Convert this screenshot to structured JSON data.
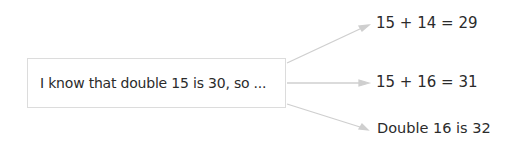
{
  "diagram": {
    "source": {
      "label": "I know that double 15 is 30, so ..."
    },
    "outcomes": [
      {
        "label": "15 + 14 = 29"
      },
      {
        "label": "15 + 16 = 31"
      },
      {
        "label": "Double 16 is 32"
      }
    ],
    "colors": {
      "arrow": "#cfcfcf",
      "box_border": "#dcdcdc",
      "text": "#2b2b2b"
    }
  }
}
